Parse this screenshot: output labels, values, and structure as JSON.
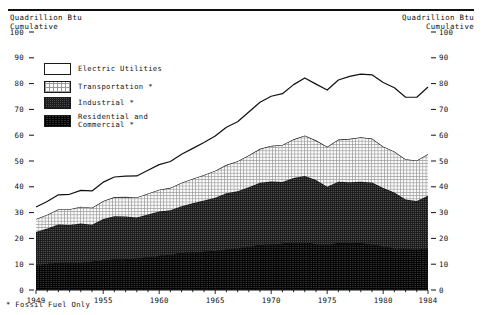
{
  "header": {
    "left_axis_title_line1": "Quadrillion Btu",
    "left_axis_title_line2": "Cumulative",
    "right_axis_title_line1": "Quadrillion Btu",
    "right_axis_title_line2": "Cumulative"
  },
  "footnote": "* Fossil Fuel Only",
  "legend": {
    "items": [
      {
        "label": "Electric Utilities",
        "swatch": "electric",
        "color": "#ffffff"
      },
      {
        "label": "Transportation *",
        "swatch": "transport",
        "color": "#f2f2f2"
      },
      {
        "label": "Industrial *",
        "swatch": "industrial",
        "color": "#4a4a4a"
      },
      {
        "label": "Residential and\nCommercial *",
        "swatch": "residential",
        "color": "#2e2e2e"
      }
    ]
  },
  "chart_data": {
    "type": "area",
    "stacked": true,
    "title": "",
    "subtitle": "",
    "xlabel": "",
    "ylabel": "Quadrillion Btu Cumulative",
    "ylabel_right": "Quadrillion Btu Cumulative",
    "xlim": [
      1949,
      1984
    ],
    "ylim": [
      0,
      100
    ],
    "ytick_labels": [
      "0",
      "10",
      "20",
      "30",
      "40",
      "50",
      "60",
      "70",
      "80",
      "90",
      "100"
    ],
    "ytick_values": [
      0,
      10,
      20,
      30,
      40,
      50,
      60,
      70,
      80,
      90,
      100
    ],
    "xtick_labels": [
      "1949",
      "1955",
      "1960",
      "1965",
      "1970",
      "1975",
      "1980",
      "1984"
    ],
    "xtick_values": [
      1949,
      1955,
      1960,
      1965,
      1970,
      1975,
      1980,
      1984
    ],
    "grid": false,
    "legend_position": "upper-left-inside",
    "x": [
      1949,
      1950,
      1951,
      1952,
      1953,
      1954,
      1955,
      1956,
      1957,
      1958,
      1959,
      1960,
      1961,
      1962,
      1963,
      1964,
      1965,
      1966,
      1967,
      1968,
      1969,
      1970,
      1971,
      1972,
      1973,
      1974,
      1975,
      1976,
      1977,
      1978,
      1979,
      1980,
      1981,
      1982,
      1983,
      1984
    ],
    "series": [
      {
        "name": "Residential and Commercial *",
        "stack_order": 1,
        "values": [
          9.9,
          10.2,
          10.6,
          10.7,
          10.8,
          11.0,
          11.5,
          11.9,
          11.9,
          12.4,
          12.7,
          13.3,
          13.7,
          14.4,
          14.7,
          14.9,
          15.2,
          15.7,
          16.2,
          16.8,
          17.5,
          17.8,
          18.0,
          18.5,
          18.5,
          17.8,
          17.6,
          18.2,
          18.1,
          18.2,
          17.7,
          17.0,
          16.2,
          16.0,
          15.7,
          16.3
        ]
      },
      {
        "name": "Industrial *",
        "stack_order": 2,
        "values": [
          12.6,
          13.6,
          14.8,
          14.5,
          15.0,
          14.3,
          16.0,
          16.7,
          16.6,
          15.7,
          16.6,
          17.1,
          17.2,
          18.1,
          18.9,
          19.8,
          20.6,
          21.8,
          22.1,
          23.0,
          24.1,
          24.3,
          23.9,
          24.9,
          25.7,
          24.8,
          22.4,
          23.8,
          23.7,
          23.8,
          24.0,
          22.5,
          21.6,
          19.1,
          18.8,
          20.2
        ]
      },
      {
        "name": "Transportation *",
        "stack_order": 3,
        "values": [
          5.0,
          5.4,
          5.9,
          6.1,
          6.5,
          6.6,
          7.0,
          7.4,
          7.6,
          7.8,
          8.1,
          8.5,
          8.7,
          9.1,
          9.5,
          9.9,
          10.4,
          11.0,
          11.6,
          12.4,
          13.1,
          13.8,
          14.3,
          15.0,
          15.7,
          15.4,
          15.5,
          16.3,
          16.8,
          17.2,
          17.0,
          16.1,
          15.9,
          15.6,
          15.7,
          16.2
        ]
      },
      {
        "name": "Electric Utilities",
        "stack_order": 4,
        "values": [
          4.7,
          5.1,
          5.6,
          5.8,
          6.3,
          6.5,
          7.3,
          7.8,
          8.0,
          8.3,
          9.0,
          9.7,
          10.2,
          11.0,
          11.8,
          12.6,
          13.5,
          14.6,
          15.3,
          16.8,
          18.1,
          19.2,
          19.9,
          21.2,
          22.3,
          21.8,
          22.0,
          23.1,
          24.2,
          24.5,
          24.7,
          24.8,
          24.7,
          24.0,
          24.5,
          26.0
        ]
      }
    ],
    "totals": [
      32.2,
      34.3,
      36.9,
      37.1,
      38.6,
      38.4,
      41.8,
      43.8,
      44.1,
      44.2,
      46.4,
      48.6,
      49.8,
      52.6,
      54.9,
      57.2,
      59.7,
      63.1,
      65.2,
      69.0,
      72.8,
      75.1,
      76.1,
      79.6,
      82.2,
      79.8,
      77.5,
      81.4,
      82.8,
      83.7,
      83.4,
      80.4,
      78.4,
      74.7,
      74.7,
      78.7
    ]
  }
}
